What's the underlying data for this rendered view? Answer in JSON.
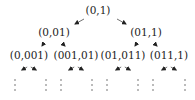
{
  "diagram": {
    "type": "binary-tree",
    "levels": [
      {
        "nodes": [
          {
            "id": "n0",
            "label": "(0,1)"
          }
        ]
      },
      {
        "nodes": [
          {
            "id": "n00",
            "label": "(0,01)",
            "parent": "n0"
          },
          {
            "id": "n01",
            "label": "(01,1)",
            "parent": "n0"
          }
        ]
      },
      {
        "nodes": [
          {
            "id": "n000",
            "label": "(0,001)",
            "parent": "n00"
          },
          {
            "id": "n001",
            "label": "(001,01)",
            "parent": "n00"
          },
          {
            "id": "n010",
            "label": "(01,011)",
            "parent": "n01"
          },
          {
            "id": "n011",
            "label": "(011,1)",
            "parent": "n01"
          }
        ]
      }
    ],
    "continuation": "vertical-ellipsis"
  }
}
